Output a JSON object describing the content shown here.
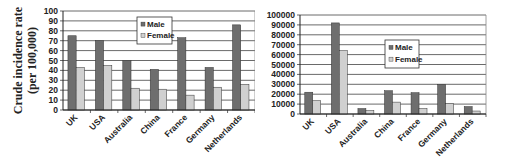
{
  "chart_data": [
    {
      "type": "bar",
      "title": "",
      "xlabel": "",
      "ylabel": "Crude incidence rate (per 100,000)",
      "ylabel_lines": [
        "Crude incidence rate",
        "(per 100,000)"
      ],
      "categories": [
        "UK",
        "USA",
        "Australia",
        "China",
        "France",
        "Germany",
        "Netherlands"
      ],
      "series": [
        {
          "name": "Male",
          "color": "#6e6e6e",
          "values": [
            75,
            70,
            50,
            41,
            73,
            43,
            86
          ]
        },
        {
          "name": "Female",
          "color": "#d0d0d0",
          "values": [
            43,
            45,
            22,
            21,
            15,
            23,
            26
          ]
        }
      ],
      "ylim": [
        0,
        100
      ],
      "yticks": [
        0,
        10,
        20,
        30,
        40,
        50,
        60,
        70,
        80,
        90,
        100
      ],
      "grid": true,
      "legend": {
        "position": "upper-center",
        "entries": [
          "Male",
          "Female"
        ]
      }
    },
    {
      "type": "bar",
      "title": "",
      "xlabel": "",
      "ylabel": "",
      "categories": [
        "UK",
        "USA",
        "Australia",
        "China",
        "France",
        "Germany",
        "Netherlands"
      ],
      "series": [
        {
          "name": "Male",
          "color": "#6e6e6e",
          "values": [
            22000,
            92000,
            5500,
            23500,
            21500,
            30000,
            7500
          ]
        },
        {
          "name": "Female",
          "color": "#d0d0d0",
          "values": [
            13500,
            64000,
            3500,
            12000,
            5500,
            10500,
            3000
          ]
        }
      ],
      "ylim": [
        0,
        100000
      ],
      "yticks": [
        0,
        10000,
        20000,
        30000,
        40000,
        50000,
        60000,
        70000,
        80000,
        90000,
        100000
      ],
      "grid": true,
      "legend": {
        "position": "center",
        "entries": [
          "Male",
          "Female"
        ]
      }
    }
  ]
}
